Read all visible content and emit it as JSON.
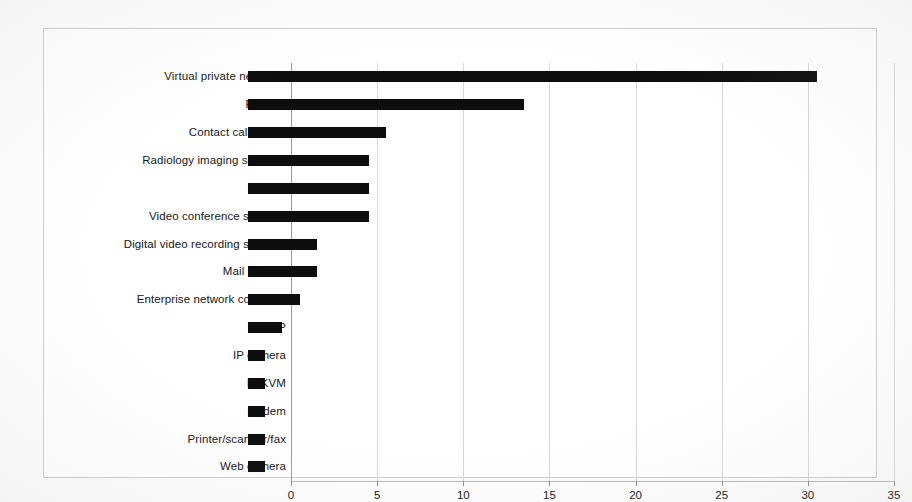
{
  "chart_data": {
    "type": "bar",
    "orientation": "horizontal",
    "title": "",
    "subtitle": "",
    "xlabel": "",
    "ylabel": "",
    "xlim": [
      0,
      35
    ],
    "xticks": [
      "0",
      "5",
      "10",
      "15",
      "20",
      "25",
      "30",
      "35"
    ],
    "xtick_values": [
      0,
      5,
      10,
      15,
      20,
      25,
      30,
      35
    ],
    "grid": true,
    "grid_axis": "x",
    "legend": false,
    "legend_position": "none",
    "bar_color": "#0d0d0d",
    "categories": [
      "Virtual private networks",
      "Firewall",
      "Contact call centre",
      "Radiology imaging software",
      "Router",
      "Video conference systems",
      "Digital video recording systems",
      "Mail servers",
      "Enterprise network controller",
      "VoIP",
      "IP camera",
      "IP KVM",
      "Modem",
      "Printer/scanner/fax",
      "Web camera"
    ],
    "values": [
      33,
      16,
      8,
      7,
      7,
      7,
      4,
      4,
      3,
      2,
      1,
      1,
      1,
      1,
      1
    ]
  }
}
